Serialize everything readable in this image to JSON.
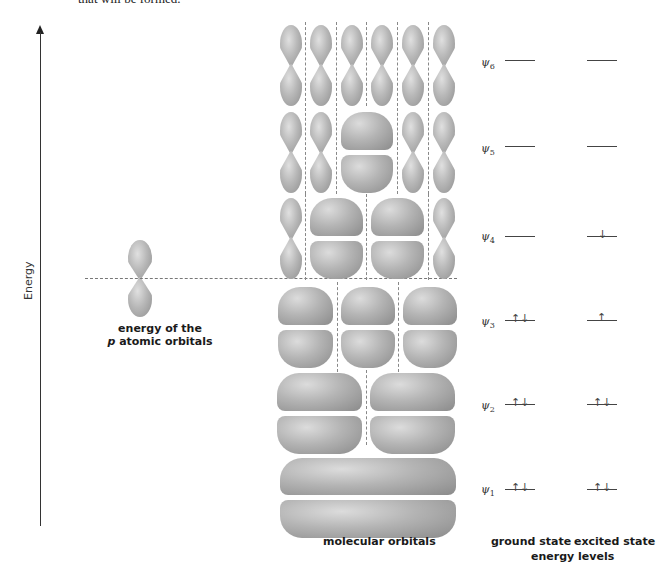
{
  "header": {
    "cut_text": "that will be formed."
  },
  "axis": {
    "label": "Energy"
  },
  "atomic_orbital": {
    "label_line1": "energy of the",
    "label_p": "p",
    "label_line2_rest": " atomic orbitals"
  },
  "molecular_orbitals": {
    "caption": "molecular orbitals",
    "rows": [
      {
        "name": "psi6",
        "nodes": 5
      },
      {
        "name": "psi5",
        "nodes": 4
      },
      {
        "name": "psi4",
        "nodes": 3
      },
      {
        "name": "psi3",
        "nodes": 2
      },
      {
        "name": "psi2",
        "nodes": 1
      },
      {
        "name": "psi1",
        "nodes": 0
      }
    ]
  },
  "energy_levels": {
    "caption": "energy levels",
    "ground_caption": "ground state",
    "excited_caption": "excited state",
    "levels": [
      {
        "psi": "ψ",
        "sub": "6",
        "ground": "",
        "excited": ""
      },
      {
        "psi": "ψ",
        "sub": "5",
        "ground": "",
        "excited": ""
      },
      {
        "psi": "ψ",
        "sub": "4",
        "ground": "",
        "excited": "↓"
      },
      {
        "psi": "ψ",
        "sub": "3",
        "ground": "↑↓",
        "excited": "↑"
      },
      {
        "psi": "ψ",
        "sub": "2",
        "ground": "↑↓",
        "excited": "↑↓"
      },
      {
        "psi": "ψ",
        "sub": "1",
        "ground": "↑↓",
        "excited": "↑↓"
      }
    ]
  }
}
